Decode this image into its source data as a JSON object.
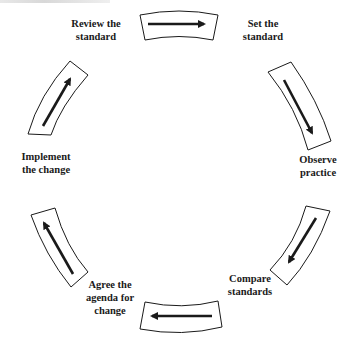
{
  "diagram": {
    "type": "cycle",
    "colors": {
      "stroke": "#1a1a1a",
      "background": "#ffffff",
      "text": "#1a1a1a"
    },
    "steps": [
      {
        "id": "set",
        "label": "Set the\nstandard"
      },
      {
        "id": "observe",
        "label": "Observe\npractice"
      },
      {
        "id": "compare",
        "label": "Compare\nstandards"
      },
      {
        "id": "agree",
        "label": "Agree the\nagenda for\nchange"
      },
      {
        "id": "implement",
        "label": "Implement\nthe change"
      },
      {
        "id": "review",
        "label": "Review the\nstandard"
      }
    ],
    "arrows": [
      {
        "from": "review",
        "to": "set",
        "direction": "right"
      },
      {
        "from": "set",
        "to": "observe",
        "direction": "down-right"
      },
      {
        "from": "observe",
        "to": "compare",
        "direction": "down-left"
      },
      {
        "from": "compare",
        "to": "agree",
        "direction": "left"
      },
      {
        "from": "agree",
        "to": "implement",
        "direction": "up-left"
      },
      {
        "from": "implement",
        "to": "review",
        "direction": "up-right"
      }
    ]
  }
}
